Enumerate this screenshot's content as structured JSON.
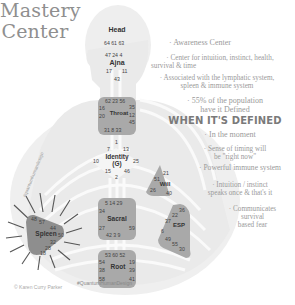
{
  "title": {
    "line1": "Mastery",
    "line2": "Center"
  },
  "centers": {
    "head": {
      "name": "Head",
      "gates": "64 61 63"
    },
    "ajna": {
      "name": "Ajna",
      "gates_top": "47 24 4",
      "gate_l": "17",
      "gate_r": "11",
      "gate_b": "43"
    },
    "throat": {
      "name": "Throat",
      "gates_top": "62 23 56",
      "gate_l1": "16",
      "gate_l2": "20",
      "gate_r1": "35",
      "gate_r2": "12",
      "gate_r3": "45",
      "gates_bottom": "31 8 33"
    },
    "identity": {
      "name": "Identity",
      "name2": "(G)",
      "gate_top": "1",
      "gate_tl": "7",
      "gate_tr": "13",
      "gate_l": "10",
      "gate_r": "25",
      "gate_bl": "15",
      "gate_br": "46",
      "gate_b": "2"
    },
    "will": {
      "name": "Will",
      "gate_t": "21",
      "gate_l": "51",
      "gate_bl": "26",
      "gate_br": "40"
    },
    "sacral": {
      "name": "Sacral",
      "gates_top": "5 14 29",
      "gate_l": "34",
      "gate_l2": "27",
      "gate_r": "59",
      "gates_bottom": "42 3 9"
    },
    "esp": {
      "name": "ESP",
      "gate_t1": "36",
      "gate_t2": "22",
      "gate_l1": "37",
      "gate_l2": "6",
      "gate_b1": "49",
      "gate_b2": "55",
      "gate_b3": "30"
    },
    "spleen": {
      "name": "Spleen",
      "gate_t1": "48",
      "gate_t2": "57",
      "gate_t3": "44",
      "gate_r": "50",
      "gate_b1": "32",
      "gate_b2": "28",
      "gate_b3": "18"
    },
    "root": {
      "name": "Root",
      "gates_top": "53 60 52",
      "gate_l1": "54",
      "gate_l2": "38",
      "gate_l3": "58",
      "gate_r1": "19",
      "gate_r2": "39",
      "gate_r3": "41"
    }
  },
  "notes": {
    "n1": "· Awareness Center",
    "n2a": "· Center for intuition, instinct, health,",
    "n2b": "survival & time",
    "n3a": "· Associated with the lymphatic system,",
    "n3b": "spleen & immune system",
    "n4a": "· 55% of the population",
    "n4b": "have it Defined",
    "header": "WHEN IT'S DEFINED",
    "d1": "· In the moment",
    "d2a": "· Sense of timing will",
    "d2b": "be \"right now\"",
    "d3": "· Powerful immune system",
    "d4a": "· Intuition / instinct",
    "d4b": "speaks once & that's it",
    "d5a": "· Communicates",
    "d5b": "survival",
    "d5c": "based fear"
  },
  "footer": {
    "copyright": "© Karen Curry Parker",
    "hashtag": "#QuantumHumanDesign",
    "vertical": "#quantumhumandesign"
  },
  "colors": {
    "center_fill": "#a9a9a9",
    "spleen_fill": "#8e8e8e",
    "body_fill": "#ececec",
    "channel": "#ffffff"
  }
}
